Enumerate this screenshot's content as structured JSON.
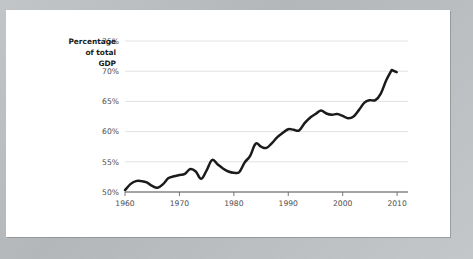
{
  "chart_data": {
    "type": "line",
    "title": "",
    "xlabel": "",
    "ylabel": "Percentage of total GDP",
    "ylabel_lines": [
      "Percentage",
      "of total",
      "GDP"
    ],
    "xlim": [
      1960,
      2012
    ],
    "ylim": [
      50,
      75
    ],
    "grid": true,
    "legend": "none",
    "y_ticks": [
      50,
      55,
      60,
      65,
      70,
      75
    ],
    "y_tick_labels": [
      "50%",
      "55%",
      "60%",
      "65%",
      "70%",
      "75%"
    ],
    "x_ticks": [
      1960,
      1970,
      1980,
      1990,
      2000,
      2010
    ],
    "x_tick_labels": [
      "1960",
      "1970",
      "1980",
      "1990",
      "2000",
      "2010"
    ],
    "line_color": "#1b1b1b",
    "grid_color": "#d8dadb",
    "axis_color": "#4a4a4a",
    "background_color": "#ffffff",
    "page_background_color": "#b9bcbe",
    "series": [
      {
        "name": "Percentage of total GDP",
        "x": [
          1960,
          1961,
          1962,
          1963,
          1964,
          1965,
          1966,
          1967,
          1968,
          1969,
          1970,
          1971,
          1972,
          1973,
          1974,
          1975,
          1976,
          1977,
          1978,
          1979,
          1980,
          1981,
          1982,
          1983,
          1984,
          1985,
          1986,
          1987,
          1988,
          1989,
          1990,
          1991,
          1992,
          1993,
          1994,
          1995,
          1996,
          1997,
          1998,
          1999,
          2000,
          2001,
          2002,
          2003,
          2004,
          2005,
          2006,
          2007,
          2008,
          2009
        ],
        "values": [
          50.3,
          51.3,
          51.8,
          51.8,
          51.6,
          51.0,
          50.7,
          51.3,
          52.3,
          52.6,
          52.8,
          53.0,
          53.8,
          53.4,
          52.2,
          53.6,
          55.3,
          54.6,
          53.9,
          53.4,
          53.2,
          53.3,
          54.9,
          56.0,
          58.0,
          57.5,
          57.3,
          58.1,
          59.1,
          59.8,
          60.4,
          60.3,
          60.2,
          61.4,
          62.3,
          62.9,
          63.5,
          63.0,
          62.8,
          62.9,
          62.6,
          62.2,
          62.5,
          63.6,
          64.8,
          65.2,
          65.2,
          66.3,
          68.5,
          70.2
        ]
      }
    ]
  }
}
